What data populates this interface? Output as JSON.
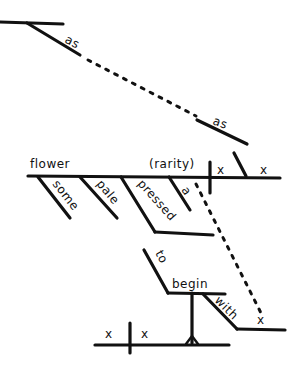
{
  "diagram": {
    "type": "sentence-diagram",
    "ink_color": "#111111",
    "background": "#ffffff",
    "top_clause": {
      "first_modifier": "as",
      "second_modifier": "as"
    },
    "main_clause": {
      "subject": "flower",
      "complement": "(rarity)",
      "verb_placeholder": "x",
      "object_placeholder": "x",
      "modifiers": [
        "some",
        "pale",
        "pressed",
        "a"
      ]
    },
    "infinitive_phrase": {
      "particle": "to",
      "verb": "begin",
      "preposition": "with",
      "object_placeholder": "x"
    },
    "base_clause": {
      "subject_placeholder": "x",
      "verb_placeholder": "x"
    }
  }
}
